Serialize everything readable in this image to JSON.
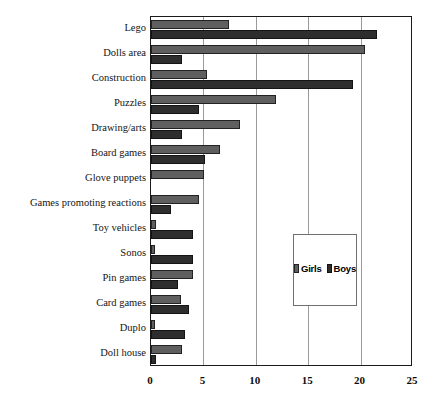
{
  "chart_data": {
    "type": "bar",
    "orientation": "horizontal",
    "title": "",
    "subtitle": "",
    "xlabel": "",
    "ylabel": "",
    "xlim": [
      0,
      25
    ],
    "xticks": [
      0,
      5,
      10,
      15,
      20,
      25
    ],
    "xtick_labels": [
      "0",
      "5",
      "10",
      "15",
      "20",
      "25"
    ],
    "grid": true,
    "grid_axis": "x",
    "legend_position": "middle-right-inside",
    "categories": [
      "Lego",
      "Dolls area",
      "Construction",
      "Puzzles",
      "Drawing/arts",
      "Board games",
      "Glove puppets",
      "Games promoting reactions",
      "Toy vehicles",
      "Sonos",
      "Pin  games",
      "Card games",
      "Duplo",
      "Doll house"
    ],
    "series": [
      {
        "name": "Girls",
        "color": "#5f5f5f",
        "values": [
          7.4,
          20.4,
          5.3,
          11.9,
          8.5,
          6.6,
          5.1,
          4.6,
          0.5,
          0.4,
          4.0,
          2.9,
          0.4,
          3.0
        ]
      },
      {
        "name": "Boys",
        "color": "#2e2e2e",
        "values": [
          21.6,
          3.0,
          19.3,
          4.6,
          3.0,
          5.2,
          0.0,
          1.9,
          4.0,
          4.0,
          2.6,
          3.6,
          3.2,
          0.5
        ]
      }
    ]
  },
  "legend": {
    "items": [
      {
        "label": "Girls"
      },
      {
        "label": "Boys"
      }
    ]
  }
}
